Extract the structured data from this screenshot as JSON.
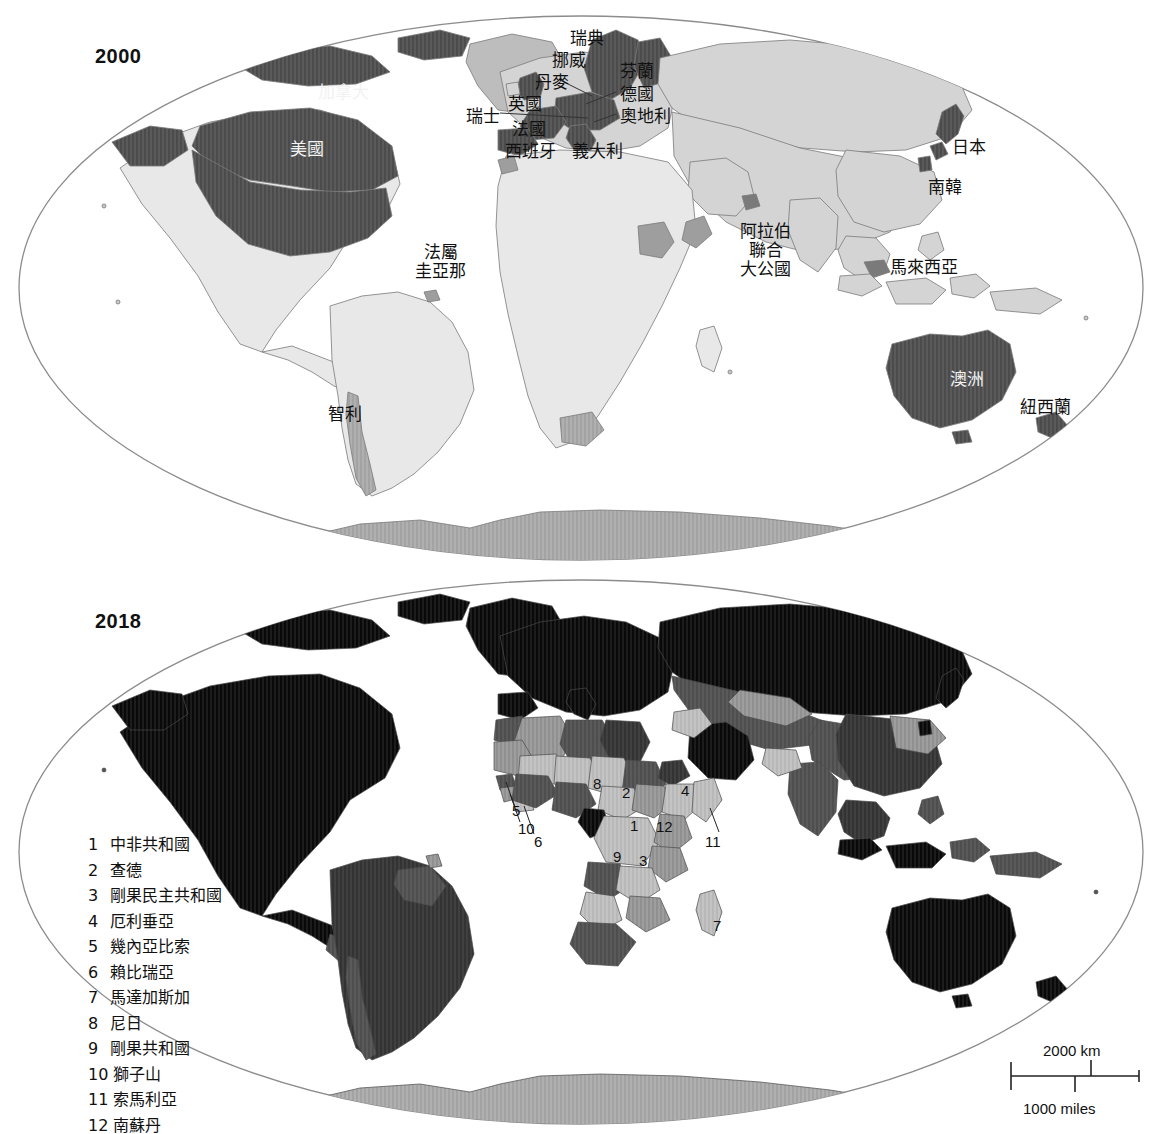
{
  "maps": [
    {
      "year": "2000",
      "labels": [
        {
          "text": "加拿大",
          "x": 318,
          "y": 83,
          "tone": "light"
        },
        {
          "text": "美國",
          "x": 290,
          "y": 140,
          "tone": "light"
        },
        {
          "text": "瑞典",
          "x": 570,
          "y": 29,
          "tone": "dark"
        },
        {
          "text": "挪威",
          "x": 552,
          "y": 51,
          "tone": "dark"
        },
        {
          "text": "丹麥",
          "x": 535,
          "y": 73,
          "tone": "dark"
        },
        {
          "text": "英國",
          "x": 508,
          "y": 95,
          "tone": "dark"
        },
        {
          "text": "瑞士",
          "x": 466,
          "y": 107,
          "tone": "dark"
        },
        {
          "text": "法國",
          "x": 512,
          "y": 120,
          "tone": "dark"
        },
        {
          "text": "西班牙",
          "x": 505,
          "y": 142,
          "tone": "dark"
        },
        {
          "text": "義大利",
          "x": 572,
          "y": 142,
          "tone": "dark"
        },
        {
          "text": "芬蘭",
          "x": 620,
          "y": 62,
          "tone": "dark"
        },
        {
          "text": "德國",
          "x": 620,
          "y": 85,
          "tone": "dark"
        },
        {
          "text": "奧地利",
          "x": 620,
          "y": 107,
          "tone": "dark"
        },
        {
          "text": "日本",
          "x": 952,
          "y": 138,
          "tone": "dark"
        },
        {
          "text": "南韓",
          "x": 928,
          "y": 178,
          "tone": "dark"
        },
        {
          "text": "馬來西亞",
          "x": 890,
          "y": 258,
          "tone": "dark"
        },
        {
          "text": "澳洲",
          "x": 950,
          "y": 370,
          "tone": "light"
        },
        {
          "text": "紐西蘭",
          "x": 1020,
          "y": 398,
          "tone": "dark"
        },
        {
          "text": "智利",
          "x": 328,
          "y": 405,
          "tone": "dark"
        }
      ],
      "stacked_labels": [
        {
          "lines": [
            "阿拉伯",
            "聯合",
            "大公國"
          ],
          "x": 740,
          "y": 222,
          "tone": "dark"
        },
        {
          "lines": [
            "法屬",
            "圭亞那"
          ],
          "x": 415,
          "y": 243,
          "tone": "dark"
        }
      ]
    },
    {
      "year": "2018",
      "numbered_markers": [
        {
          "num": "8",
          "x": 593,
          "y": 775
        },
        {
          "num": "2",
          "x": 622,
          "y": 784
        },
        {
          "num": "4",
          "x": 681,
          "y": 782
        },
        {
          "num": "5",
          "x": 512,
          "y": 802
        },
        {
          "num": "10",
          "x": 518,
          "y": 820
        },
        {
          "num": "6",
          "x": 534,
          "y": 833
        },
        {
          "num": "1",
          "x": 630,
          "y": 817
        },
        {
          "num": "12",
          "x": 656,
          "y": 818
        },
        {
          "num": "11",
          "x": 705,
          "y": 833
        },
        {
          "num": "9",
          "x": 613,
          "y": 848
        },
        {
          "num": "3",
          "x": 639,
          "y": 852
        },
        {
          "num": "7",
          "x": 713,
          "y": 917
        }
      ],
      "legend": [
        {
          "num": "1",
          "name": "中非共和國"
        },
        {
          "num": "2",
          "name": "查德"
        },
        {
          "num": "3",
          "name": "剛果民主共和國"
        },
        {
          "num": "4",
          "name": "厄利垂亞"
        },
        {
          "num": "5",
          "name": "幾內亞比索"
        },
        {
          "num": "6",
          "name": "賴比瑞亞"
        },
        {
          "num": "7",
          "name": "馬達加斯加"
        },
        {
          "num": "8",
          "name": "尼日"
        },
        {
          "num": "9",
          "name": "剛果共和國"
        },
        {
          "num": "10",
          "name": "獅子山"
        },
        {
          "num": "11",
          "name": "索馬利亞"
        },
        {
          "num": "12",
          "name": "南蘇丹"
        }
      ],
      "scalebar": {
        "km": "2000 km",
        "miles": "1000 miles"
      }
    }
  ],
  "colors": {
    "outline": "#8c8c8c",
    "very_light": "#e8e8e8",
    "light": "#d4d4d4",
    "medium_light": "#bdbdbd",
    "medium": "#9e9e9e",
    "medium_dark": "#7a7a7a",
    "dark": "#5a5a5a",
    "very_dark": "#404040",
    "near_black": "#1c1c1c",
    "antarctica": "#b0b0b0",
    "text_dark": "#111111",
    "text_light": "#f2f2f2"
  }
}
